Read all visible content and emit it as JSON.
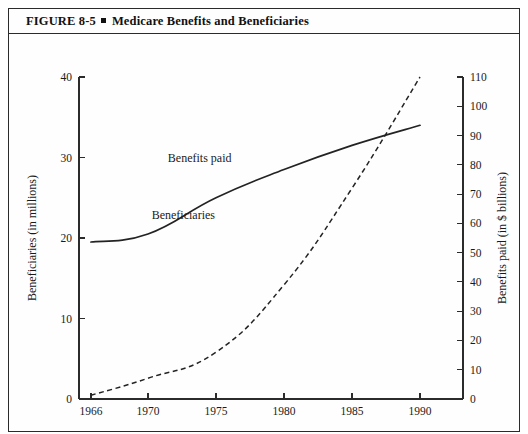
{
  "figure": {
    "label": "FIGURE 8-5",
    "separator": "▪",
    "title": "Medicare Benefits and Beneficiaries",
    "full_title": "FIGURE 8-5 ▪ Medicare Benefits and Beneficiaries"
  },
  "chart_data": {
    "type": "line",
    "title": "Medicare Benefits and Beneficiaries",
    "xlabel": "",
    "ylabel": "Beneficiaries (in millions)",
    "y2label": "Benefits paid (in $ billions)",
    "x": [
      1966,
      1970,
      1975,
      1980,
      1985,
      1990
    ],
    "xtick_labels": [
      "1966",
      "1970",
      "1975",
      "1980",
      "1985",
      "1990"
    ],
    "xlim": [
      1966,
      1990
    ],
    "ylim": [
      0,
      40
    ],
    "ytick_labels": [
      "0",
      "10",
      "20",
      "30",
      "40"
    ],
    "ytick_values": [
      0,
      10,
      20,
      30,
      40
    ],
    "y2lim": [
      0,
      110
    ],
    "y2tick_labels": [
      "0",
      "10",
      "20",
      "30",
      "40",
      "50",
      "60",
      "70",
      "80",
      "90",
      "100",
      "110"
    ],
    "y2tick_values": [
      0,
      10,
      20,
      30,
      40,
      50,
      60,
      70,
      80,
      90,
      100,
      110
    ],
    "grid": false,
    "legend": "inline-labels",
    "series": [
      {
        "name": "Beneficiaries",
        "axis": "left",
        "unit": "millions",
        "style": "solid",
        "label_x": 1972.6,
        "label_y": 22.4,
        "values": [
          19.5,
          20.5,
          25.0,
          28.5,
          31.5,
          34.0
        ]
      },
      {
        "name": "Benefits paid",
        "axis": "right",
        "unit": "$ billions",
        "style": "dashed",
        "label_x": 1973.8,
        "label_y": 29.5,
        "values": [
          1.3,
          7.1,
          16.0,
          39.0,
          72.0,
          110.0
        ]
      }
    ]
  }
}
